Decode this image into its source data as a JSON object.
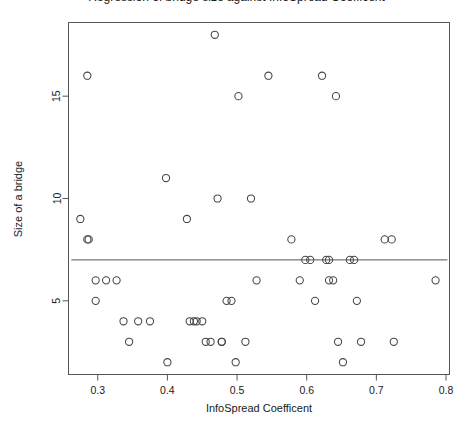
{
  "chart_data": {
    "type": "scatter",
    "title": "Regression of bridge size against InfoSpread Coefficent",
    "xlabel": "InfoSpread Coefficent",
    "ylabel": "Size of a bridge",
    "xlim": [
      0.258,
      0.805
    ],
    "ylim": [
      1.4,
      18.6
    ],
    "xticks": [
      0.3,
      0.4,
      0.5,
      0.6,
      0.7,
      0.8
    ],
    "xtick_labels": [
      "0.3",
      "0.4",
      "0.5",
      "0.6",
      "0.7",
      "0.8"
    ],
    "yticks": [
      5,
      10,
      15
    ],
    "ytick_labels": [
      "5",
      "10",
      "15"
    ],
    "grid": false,
    "legend": "none",
    "marker": "open-circle",
    "marker_color": "#444444",
    "frame_color": "#555555",
    "background": "#ffffff",
    "regression_line": {
      "type": "horizontal",
      "y": 7.0,
      "x_start": 0.262,
      "x_end": 0.802,
      "color": "#555555"
    },
    "x": [
      0.275,
      0.285,
      0.285,
      0.287,
      0.297,
      0.312,
      0.297,
      0.327,
      0.337,
      0.345,
      0.358,
      0.375,
      0.398,
      0.4,
      0.428,
      0.432,
      0.438,
      0.442,
      0.45,
      0.455,
      0.462,
      0.468,
      0.472,
      0.478,
      0.478,
      0.485,
      0.492,
      0.498,
      0.502,
      0.512,
      0.52,
      0.528,
      0.545,
      0.578,
      0.59,
      0.598,
      0.605,
      0.612,
      0.622,
      0.628,
      0.632,
      0.632,
      0.638,
      0.642,
      0.645,
      0.652,
      0.662,
      0.668,
      0.672,
      0.678,
      0.712,
      0.722,
      0.725,
      0.785
    ],
    "y": [
      9,
      16,
      8,
      8,
      6,
      6,
      5,
      6,
      4,
      3,
      4,
      4,
      11,
      2,
      9,
      4,
      4,
      4,
      4,
      3,
      3,
      18,
      10,
      3,
      3,
      5,
      5,
      2,
      15,
      3,
      10,
      6,
      16,
      8,
      6,
      7,
      7,
      5,
      16,
      7,
      7,
      6,
      6,
      15,
      3,
      2,
      7,
      7,
      5,
      3,
      8,
      8,
      3,
      6
    ],
    "n_points": 54
  }
}
